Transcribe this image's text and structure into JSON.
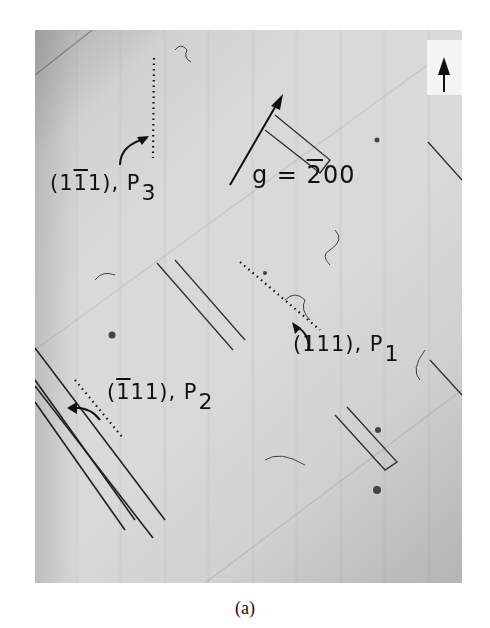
{
  "figure": {
    "caption": "(a)",
    "orientation_marker": "up-arrow-icon",
    "labels": {
      "p3": {
        "open": "(1",
        "bar": "1",
        "close": "1), P",
        "sub": "3"
      },
      "g_vector": {
        "prefix": "g = ",
        "bar": "2",
        "suffix": "00"
      },
      "p1": {
        "text": "(111), P",
        "sub": "1"
      },
      "p2": {
        "open": "(",
        "bar": "1",
        "close": "11), P",
        "sub": "2"
      }
    }
  }
}
